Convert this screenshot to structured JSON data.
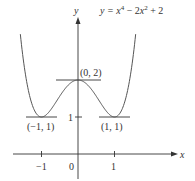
{
  "chart_data": {
    "type": "line",
    "equation": {
      "y": "y = ",
      "x": "x",
      "exp4": "4",
      "mid": " − 2",
      "x2": "x",
      "exp2": "2",
      "tail": " + 2"
    },
    "xlabel": "x",
    "ylabel": "y",
    "x_ticks": [
      {
        "value": -1,
        "label": "−1"
      },
      {
        "value": 0,
        "label": "0"
      },
      {
        "value": 1,
        "label": "1"
      }
    ],
    "y_ticks": [
      {
        "value": 1,
        "label": "1"
      }
    ],
    "xlim": [
      -1.8,
      2.6
    ],
    "ylim": [
      -0.7,
      3.7
    ],
    "series": [
      {
        "name": "y = x^4 - 2x^2 + 2",
        "x": [
          -1.6,
          -1.5,
          -1.25,
          -1,
          -0.75,
          -0.5,
          -0.25,
          0,
          0.25,
          0.5,
          0.75,
          1,
          1.25,
          1.5,
          1.6
        ],
        "y": [
          3.43,
          2.56,
          1.32,
          1,
          1.19,
          1.56,
          1.88,
          2,
          1.88,
          1.56,
          1.19,
          1,
          1.32,
          2.56,
          3.43
        ]
      }
    ],
    "annotations": [
      {
        "label": "(0, 2)",
        "x": 0,
        "y": 2,
        "note": "local maximum, horizontal tangent"
      },
      {
        "label": "(−1, 1)",
        "x": -1,
        "y": 1,
        "note": "local minimum, horizontal tangent"
      },
      {
        "label": "(1, 1)",
        "x": 1,
        "y": 1,
        "note": "local minimum, horizontal tangent"
      }
    ],
    "grid": false,
    "legend": "none"
  }
}
